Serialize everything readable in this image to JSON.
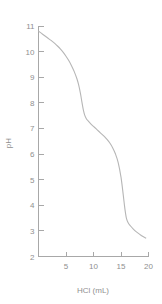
{
  "chart_data": {
    "type": "line",
    "title": "",
    "subtitle": "",
    "xlabel": "HCl (mL)",
    "ylabel": "pH",
    "xlim": [
      0,
      20
    ],
    "ylim": [
      2,
      11
    ],
    "grid": false,
    "legend": null,
    "legend_position": "none",
    "xticks": [
      5,
      10,
      15,
      20
    ],
    "xtick_labels": [
      "5",
      "10",
      "15",
      "20"
    ],
    "yticks": [
      2,
      3,
      4,
      5,
      6,
      7,
      8,
      9,
      10,
      11
    ],
    "ytick_labels": [
      "2",
      "3",
      "4",
      "5",
      "6",
      "7",
      "8",
      "9",
      "10",
      "11"
    ],
    "series": [
      {
        "name": "titration curve",
        "color": "#b6b6b6",
        "x": [
          0.0,
          0.5,
          1.0,
          1.5,
          2.0,
          2.5,
          3.0,
          3.5,
          4.0,
          4.5,
          5.0,
          5.5,
          6.0,
          6.5,
          7.0,
          7.3,
          7.6,
          7.8,
          8.0,
          8.2,
          8.4,
          8.7,
          9.0,
          9.5,
          10.0,
          10.5,
          11.0,
          11.5,
          12.0,
          12.5,
          13.0,
          13.5,
          14.0,
          14.5,
          15.0,
          15.3,
          15.6,
          15.8,
          16.0,
          16.3,
          16.7,
          17.2,
          17.8,
          18.5,
          19.0,
          19.5
        ],
        "y": [
          10.8,
          10.72,
          10.64,
          10.56,
          10.48,
          10.4,
          10.31,
          10.21,
          10.1,
          9.97,
          9.82,
          9.65,
          9.45,
          9.22,
          8.93,
          8.7,
          8.4,
          8.15,
          7.9,
          7.68,
          7.52,
          7.38,
          7.3,
          7.18,
          7.08,
          6.98,
          6.88,
          6.78,
          6.68,
          6.56,
          6.42,
          6.24,
          6.0,
          5.66,
          5.1,
          4.6,
          4.05,
          3.72,
          3.48,
          3.32,
          3.2,
          3.08,
          2.96,
          2.85,
          2.78,
          2.72
        ]
      }
    ]
  },
  "axes": {
    "y_axis_title": "pH",
    "x_axis_title": "HCl (mL)"
  },
  "colors": {
    "curve": "#b6b6b6",
    "axis": "#a8a8a8",
    "text": "#8f8f8f",
    "background": "#ffffff"
  }
}
